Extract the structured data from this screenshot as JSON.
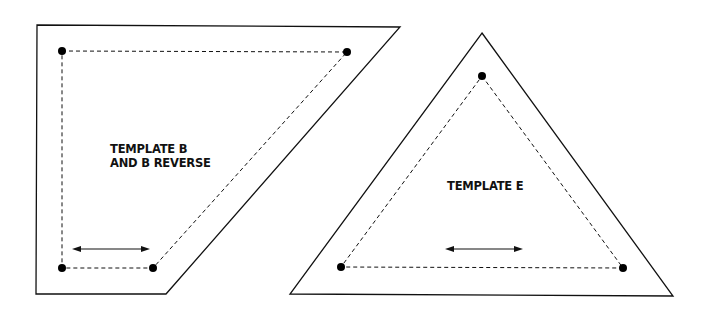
{
  "colors": {
    "background": "#ffffff",
    "stroke": "#111111",
    "dot": "#000000"
  },
  "templates": [
    {
      "id": "template-b",
      "label_lines": [
        "TEMPLATE B",
        "AND B REVERSE"
      ],
      "label_pos": [
        110,
        142
      ],
      "outline": [
        [
          37,
          25
        ],
        [
          400,
          27
        ],
        [
          166,
          294
        ],
        [
          36,
          294
        ]
      ],
      "seam_points": [
        [
          62,
          51
        ],
        [
          347,
          52
        ],
        [
          153,
          268
        ],
        [
          62,
          268
        ]
      ],
      "grain_arrow": [
        [
          72,
          249
        ],
        [
          150,
          249
        ]
      ]
    },
    {
      "id": "template-e",
      "label_lines": [
        "TEMPLATE E"
      ],
      "label_pos": [
        447,
        179
      ],
      "outline": [
        [
          482,
          33
        ],
        [
          673,
          296
        ],
        [
          290,
          294
        ]
      ],
      "seam_points": [
        [
          482,
          76
        ],
        [
          623,
          268
        ],
        [
          341,
          267
        ]
      ],
      "grain_arrow": [
        [
          445,
          249
        ],
        [
          523,
          249
        ]
      ]
    }
  ]
}
